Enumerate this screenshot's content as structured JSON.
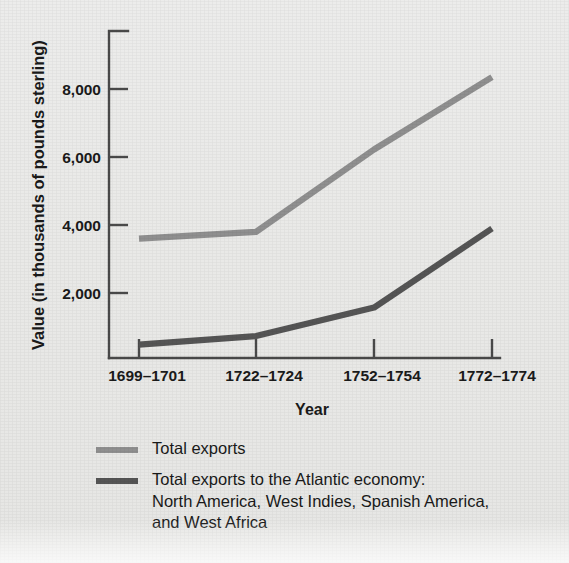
{
  "figure": {
    "background_color": "#e8e8e6",
    "series_colors": {
      "total_exports": "#8f8f8f",
      "atlantic_exports": "#555555"
    },
    "axis_color": "#4a4a4a"
  },
  "axes": {
    "y_title": "Value (in thousands of pounds sterling)",
    "x_title": "Year",
    "y_ticks": [
      "2,000",
      "4,000",
      "6,000",
      "8,000"
    ],
    "x_ticks": [
      "1699–1701",
      "1722–1724",
      "1752–1754",
      "1772–1774"
    ]
  },
  "legend": {
    "items": [
      {
        "swatch": "light",
        "label": "Total exports"
      },
      {
        "swatch": "dark",
        "label": "Total exports to the Atlantic economy:\nNorth America, West Indies, Spanish America,\nand West Africa"
      }
    ]
  },
  "chart_data": {
    "type": "line",
    "title": "",
    "xlabel": "Year",
    "ylabel": "Value (in thousands of pounds sterling)",
    "categories": [
      "1699–1701",
      "1722–1724",
      "1752–1754",
      "1772–1774"
    ],
    "ylim": [
      0,
      9000
    ],
    "yticks": [
      2000,
      4000,
      6000,
      8000
    ],
    "ytick_labels": [
      "2,000",
      "4,000",
      "6,000",
      "8,000"
    ],
    "grid": false,
    "legend_position": "below-plot-left",
    "series": [
      {
        "name": "Total exports",
        "color": "#8f8f8f",
        "values": [
          3550,
          3750,
          6200,
          8350
        ]
      },
      {
        "name": "Total exports to the Atlantic economy: North America, West Indies, Spanish America, and West Africa",
        "color": "#555555",
        "values": [
          400,
          650,
          1500,
          3850
        ]
      }
    ]
  }
}
